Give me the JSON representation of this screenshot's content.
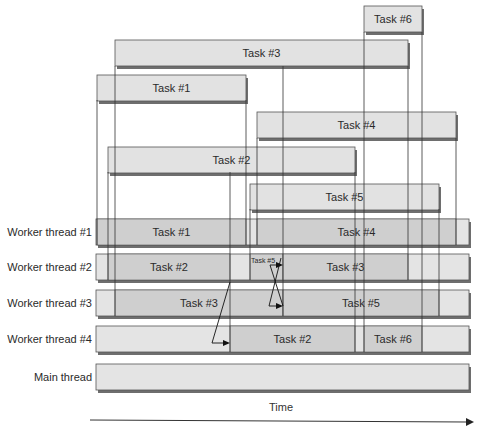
{
  "colors": {
    "task_fill": "#e2e2e2",
    "thread_fill": "#e4e4e4",
    "busy_fill": "#cfcfcf",
    "stroke": "#555555",
    "shadow": "#6e6e6e",
    "line": "#333333"
  },
  "tasks": [
    {
      "id": "task-6",
      "label": "Task #6",
      "start": 364,
      "end": 422
    },
    {
      "id": "task-3",
      "label": "Task #3",
      "start": 115,
      "end": 408
    },
    {
      "id": "task-1",
      "label": "Task #1",
      "start": 97,
      "end": 246
    },
    {
      "id": "task-4",
      "label": "Task #4",
      "start": 257,
      "end": 456
    },
    {
      "id": "task-2",
      "label": "Task #2",
      "start": 108,
      "end": 355
    },
    {
      "id": "task-5",
      "label": "Task #5",
      "start": 250,
      "end": 439
    }
  ],
  "threads": [
    {
      "id": "worker-thread-1",
      "label": "Worker thread #1",
      "segments": [
        {
          "label": "Task #1",
          "start": 97,
          "end": 246
        },
        {
          "label": "Task #4",
          "start": 257,
          "end": 456
        }
      ]
    },
    {
      "id": "worker-thread-2",
      "label": "Worker thread #2",
      "segments": [
        {
          "label": "Task #2",
          "start": 108,
          "end": 230
        },
        {
          "label": "Task #5",
          "start": 250,
          "end": 283,
          "small": true
        },
        {
          "label": "Task #3",
          "start": 283,
          "end": 408
        }
      ]
    },
    {
      "id": "worker-thread-3",
      "label": "Worker thread #3",
      "segments": [
        {
          "label": "Task #3",
          "start": 115,
          "end": 283
        },
        {
          "label": "Task #5",
          "start": 283,
          "end": 439
        }
      ]
    },
    {
      "id": "worker-thread-4",
      "label": "Worker thread #4",
      "segments": [
        {
          "label": "Task #2",
          "start": 230,
          "end": 355
        },
        {
          "label": "Task #6",
          "start": 364,
          "end": 422
        }
      ]
    },
    {
      "id": "main-thread",
      "label": "Main thread",
      "segments": []
    }
  ],
  "migrations": [
    {
      "from_thread": 1,
      "to_thread": 3,
      "task": "Task #2"
    },
    {
      "from_thread": 2,
      "to_thread": 1,
      "task": "Task #3"
    },
    {
      "from_thread": 1,
      "to_thread": 2,
      "task": "Task #5"
    }
  ],
  "axis": {
    "label": "Time"
  }
}
